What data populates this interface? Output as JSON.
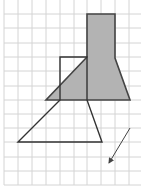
{
  "diagram": {
    "title": "Grid with shaded figure, outlined image figure and translation arrow",
    "grid": {
      "x_lines": [
        4,
        18,
        32,
        46,
        60,
        74,
        87,
        101,
        115,
        129
      ],
      "y_lines": [
        14,
        28,
        43,
        57,
        71,
        86,
        100,
        114,
        128,
        142,
        157,
        171,
        185
      ],
      "x_min": 4,
      "x_max": 141,
      "y_min": 0,
      "y_max": 185,
      "color": "#d4d4d4"
    },
    "shaded_figure": {
      "points": "87,14 115,14 115,58 130,100 46,100 87,57",
      "fill": "#b3b3b3",
      "stroke": "#444444"
    },
    "outlined_figure": {
      "points": "60,100 60,57 87,57 87,100 102,142 18,142",
      "fill": "none",
      "stroke": "#333333"
    },
    "arrow": {
      "x1": 130,
      "y1": 128,
      "x2": 109,
      "y2": 163,
      "color": "#444444",
      "icon": "arrow-down-left-icon"
    }
  }
}
